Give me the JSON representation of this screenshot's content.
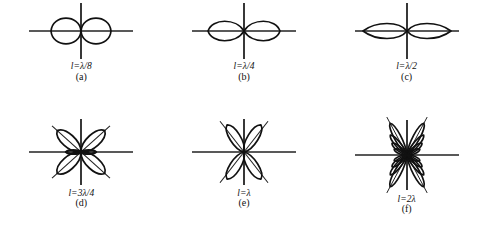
{
  "figure": {
    "background_color": "#ffffff",
    "line_color": "#111111",
    "axis_color": "#222222"
  },
  "panels": [
    {
      "id": "panel-a",
      "expr": "l=λ/8",
      "index": "(a)",
      "length_label": "λ/8",
      "lobe_count": 2,
      "pattern": "two-circular-lobes-horizontal",
      "plot": {
        "width": 118,
        "height": 62,
        "h_axis_length": 104,
        "v_axis_length": 56,
        "lobes": [
          {
            "angle_deg": 0,
            "length": 30,
            "width": 30,
            "shape": "circle"
          },
          {
            "angle_deg": 180,
            "length": 30,
            "width": 30,
            "shape": "circle"
          }
        ]
      }
    },
    {
      "id": "panel-b",
      "expr": "l=λ/4",
      "index": "(b)",
      "length_label": "λ/4",
      "lobe_count": 2,
      "pattern": "figure-eight-horizontal",
      "plot": {
        "width": 118,
        "height": 62,
        "h_axis_length": 104,
        "v_axis_length": 56,
        "lobes": [
          {
            "angle_deg": 0,
            "length": 36,
            "width": 26,
            "shape": "petal"
          },
          {
            "angle_deg": 180,
            "length": 36,
            "width": 26,
            "shape": "petal"
          }
        ]
      }
    },
    {
      "id": "panel-c",
      "expr": "l=λ/2",
      "index": "(c)",
      "length_label": "λ/2",
      "lobe_count": 2,
      "pattern": "flattened-figure-eight-horizontal",
      "plot": {
        "width": 118,
        "height": 62,
        "h_axis_length": 104,
        "v_axis_length": 56,
        "lobes": [
          {
            "angle_deg": 0,
            "length": 44,
            "width": 20,
            "shape": "petal-flat"
          },
          {
            "angle_deg": 180,
            "length": 44,
            "width": 20,
            "shape": "petal-flat"
          }
        ]
      }
    },
    {
      "id": "panel-d",
      "expr": "l=3λ/4",
      "index": "(d)",
      "length_label": "3λ/4",
      "lobe_count": 4,
      "pattern": "four-lobe-clover-with-small-side-lobes",
      "plot": {
        "width": 118,
        "height": 74,
        "h_axis_length": 104,
        "v_axis_length": 66,
        "diagonal_axis_deg": 42,
        "lobes": [
          {
            "angle_deg": 42,
            "length": 32,
            "width": 17,
            "shape": "petal"
          },
          {
            "angle_deg": 138,
            "length": 32,
            "width": 17,
            "shape": "petal"
          },
          {
            "angle_deg": 222,
            "length": 32,
            "width": 17,
            "shape": "petal"
          },
          {
            "angle_deg": 318,
            "length": 32,
            "width": 17,
            "shape": "petal"
          },
          {
            "angle_deg": 0,
            "length": 15,
            "width": 5,
            "shape": "minor"
          },
          {
            "angle_deg": 180,
            "length": 15,
            "width": 5,
            "shape": "minor"
          }
        ]
      }
    },
    {
      "id": "panel-e",
      "expr": "l=λ",
      "index": "(e)",
      "length_label": "λ",
      "lobe_count": 4,
      "pattern": "four-lobe-vertical-clover",
      "plot": {
        "width": 118,
        "height": 74,
        "h_axis_length": 104,
        "v_axis_length": 66,
        "diagonal_axis_deg": 52,
        "lobes": [
          {
            "angle_deg": 58,
            "length": 32,
            "width": 14,
            "shape": "petal"
          },
          {
            "angle_deg": 122,
            "length": 32,
            "width": 14,
            "shape": "petal"
          },
          {
            "angle_deg": 238,
            "length": 32,
            "width": 14,
            "shape": "petal"
          },
          {
            "angle_deg": 302,
            "length": 32,
            "width": 14,
            "shape": "petal"
          }
        ]
      }
    },
    {
      "id": "panel-f",
      "expr": "l=2λ",
      "index": "(f)",
      "length_label": "2λ",
      "lobe_count": 16,
      "pattern": "multi-lobe-fan-vertical",
      "plot": {
        "width": 118,
        "height": 80,
        "h_axis_length": 104,
        "v_axis_length": 70,
        "major_lobe_angles_deg": [
          62,
          118,
          242,
          298
        ],
        "lobes": [
          {
            "angle_deg": 62,
            "length": 36,
            "width": 9,
            "shape": "narrow"
          },
          {
            "angle_deg": 118,
            "length": 36,
            "width": 9,
            "shape": "narrow"
          },
          {
            "angle_deg": 242,
            "length": 36,
            "width": 9,
            "shape": "narrow"
          },
          {
            "angle_deg": 298,
            "length": 36,
            "width": 9,
            "shape": "narrow"
          },
          {
            "angle_deg": 50,
            "length": 26,
            "width": 7,
            "shape": "narrow"
          },
          {
            "angle_deg": 130,
            "length": 26,
            "width": 7,
            "shape": "narrow"
          },
          {
            "angle_deg": 230,
            "length": 26,
            "width": 7,
            "shape": "narrow"
          },
          {
            "angle_deg": 310,
            "length": 26,
            "width": 7,
            "shape": "narrow"
          },
          {
            "angle_deg": 38,
            "length": 19,
            "width": 6,
            "shape": "narrow"
          },
          {
            "angle_deg": 142,
            "length": 19,
            "width": 6,
            "shape": "narrow"
          },
          {
            "angle_deg": 218,
            "length": 19,
            "width": 6,
            "shape": "narrow"
          },
          {
            "angle_deg": 322,
            "length": 19,
            "width": 6,
            "shape": "narrow"
          },
          {
            "angle_deg": 24,
            "length": 14,
            "width": 5,
            "shape": "narrow"
          },
          {
            "angle_deg": 156,
            "length": 14,
            "width": 5,
            "shape": "narrow"
          },
          {
            "angle_deg": 204,
            "length": 14,
            "width": 5,
            "shape": "narrow"
          },
          {
            "angle_deg": 336,
            "length": 14,
            "width": 5,
            "shape": "narrow"
          }
        ]
      }
    }
  ]
}
